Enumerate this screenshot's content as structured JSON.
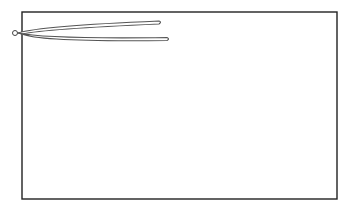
{
  "diagram": {
    "colors": {
      "background": "#ffffff",
      "frame_stroke": "#222222",
      "tool_outline": "#555555",
      "tool_fill": "#ffffff"
    },
    "frame": {
      "x": 22,
      "y": 12,
      "width": 315,
      "height": 187
    },
    "tool": {
      "type": "tweezers",
      "pivot": {
        "cx": 15,
        "cy": 33,
        "r": 2.5
      },
      "upper_arm_tip": {
        "x": 160,
        "y": 22
      },
      "lower_arm_tip": {
        "x": 168,
        "y": 39
      }
    }
  }
}
